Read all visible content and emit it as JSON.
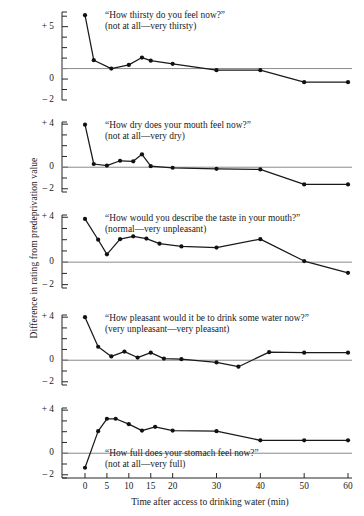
{
  "figure": {
    "ylabel": "Difference in rating from predeprivation value",
    "xlabel": "Time after access to drinking water (min)"
  },
  "chart_data": {
    "type": "line",
    "title": "",
    "xlabel": "Time after access to drinking water (min)",
    "ylabel": "Difference in rating from predeprivation value",
    "xlim": [
      -3,
      62
    ],
    "xticks": [
      0,
      5,
      10,
      15,
      20,
      30,
      40,
      50,
      60
    ],
    "xticklabels": [
      "0",
      "5",
      "10",
      "15",
      "20",
      "30",
      "40",
      "50",
      "60"
    ],
    "grid": false,
    "legend": false,
    "panels": [
      {
        "id": "thirsty",
        "question": "“How thirsty do you feel now?”",
        "anchors": "(not at all—very thirsty)",
        "ylim": [
          -2,
          6.4
        ],
        "yticks": [
          -2,
          -1,
          0,
          1,
          2,
          3,
          4,
          5,
          6
        ],
        "yticklabels": {
          "5": "+ 5",
          "0": "0",
          "-2": "– 2"
        },
        "reference_line": 1.0,
        "x": [
          0,
          2,
          6,
          10,
          13,
          15,
          20,
          30,
          40,
          50,
          60
        ],
        "y": [
          6.1,
          1.8,
          1.0,
          1.35,
          2.05,
          1.75,
          1.45,
          0.85,
          0.85,
          -0.3,
          -0.3
        ]
      },
      {
        "id": "dry-mouth",
        "question": "“How dry does your mouth feel now?”",
        "anchors": "(not at all—very dry)",
        "ylim": [
          -2.3,
          4.2
        ],
        "yticks": [
          -2,
          -1,
          0,
          1,
          2,
          3,
          4
        ],
        "yticklabels": {
          "4": "+ 4",
          "0": "0",
          "-2": "– 2"
        },
        "reference_line": 0.0,
        "x": [
          0,
          2,
          5,
          8,
          11,
          13,
          15,
          20,
          30,
          40,
          50,
          60
        ],
        "y": [
          3.95,
          0.3,
          0.15,
          0.6,
          0.55,
          1.2,
          0.1,
          -0.05,
          -0.15,
          -0.2,
          -1.6,
          -1.6
        ]
      },
      {
        "id": "taste",
        "question": "“How would you describe the taste in your mouth?”",
        "anchors": "(normal—very unpleasant)",
        "ylim": [
          -2.3,
          4.2
        ],
        "yticks": [
          -2,
          -1,
          0,
          1,
          2,
          3,
          4
        ],
        "yticklabels": {
          "4": "+ 4",
          "0": "0",
          "-2": "– 2"
        },
        "reference_line": 0.0,
        "x": [
          0,
          3,
          6,
          9,
          12,
          15,
          20,
          30,
          40,
          50,
          60
        ],
        "y": [
          3.85,
          2.0,
          0.7,
          2.05,
          2.3,
          2.1,
          1.65,
          1.4,
          1.3,
          2.05,
          0.1,
          -0.95
        ],
        "note": "x has 12 entries in y; see points array",
        "points": [
          {
            "x": 0,
            "y": 3.85
          },
          {
            "x": 3,
            "y": 2.0
          },
          {
            "x": 5,
            "y": 0.7
          },
          {
            "x": 8,
            "y": 2.05
          },
          {
            "x": 11,
            "y": 2.3
          },
          {
            "x": 14,
            "y": 2.1
          },
          {
            "x": 17,
            "y": 1.65
          },
          {
            "x": 22,
            "y": 1.4
          },
          {
            "x": 30,
            "y": 1.3
          },
          {
            "x": 40,
            "y": 2.05
          },
          {
            "x": 50,
            "y": 0.1
          },
          {
            "x": 60,
            "y": -0.95
          }
        ]
      },
      {
        "id": "pleasant",
        "question": "“How pleasant would it be to drink some water now?”",
        "anchors": "(very unpleasant—very pleasant)",
        "ylim": [
          -2.3,
          4.2
        ],
        "yticks": [
          -2,
          -1,
          0,
          1,
          2,
          3,
          4
        ],
        "yticklabels": {
          "4": "+ 4",
          "0": "0",
          "-2": "– 2"
        },
        "reference_line": 0.0,
        "points": [
          {
            "x": 0,
            "y": 4.0
          },
          {
            "x": 3,
            "y": 1.25
          },
          {
            "x": 6,
            "y": 0.35
          },
          {
            "x": 9,
            "y": 0.8
          },
          {
            "x": 12,
            "y": 0.25
          },
          {
            "x": 15,
            "y": 0.7
          },
          {
            "x": 18,
            "y": 0.15
          },
          {
            "x": 22,
            "y": 0.1
          },
          {
            "x": 30,
            "y": -0.2
          },
          {
            "x": 35,
            "y": -0.6
          },
          {
            "x": 42,
            "y": 0.75
          },
          {
            "x": 50,
            "y": 0.7
          },
          {
            "x": 60,
            "y": 0.7
          }
        ]
      },
      {
        "id": "stomach-full",
        "question": "“How full does your stomach feel now?”",
        "anchors": "(not at all—very full)",
        "ylim": [
          -2.3,
          4.2
        ],
        "yticks": [
          -2,
          -1,
          0,
          1,
          2,
          3,
          4
        ],
        "yticklabels": {
          "4": "+ 4",
          "0": "0",
          "-2": "– 2"
        },
        "reference_line": 0.0,
        "points": [
          {
            "x": 0,
            "y": -1.35
          },
          {
            "x": 3,
            "y": 2.05
          },
          {
            "x": 5,
            "y": 3.2
          },
          {
            "x": 7,
            "y": 3.2
          },
          {
            "x": 10,
            "y": 2.7
          },
          {
            "x": 13,
            "y": 2.1
          },
          {
            "x": 16,
            "y": 2.45
          },
          {
            "x": 20,
            "y": 2.1
          },
          {
            "x": 30,
            "y": 2.05
          },
          {
            "x": 40,
            "y": 1.2
          },
          {
            "x": 50,
            "y": 1.2
          },
          {
            "x": 60,
            "y": 1.2
          }
        ]
      }
    ]
  }
}
